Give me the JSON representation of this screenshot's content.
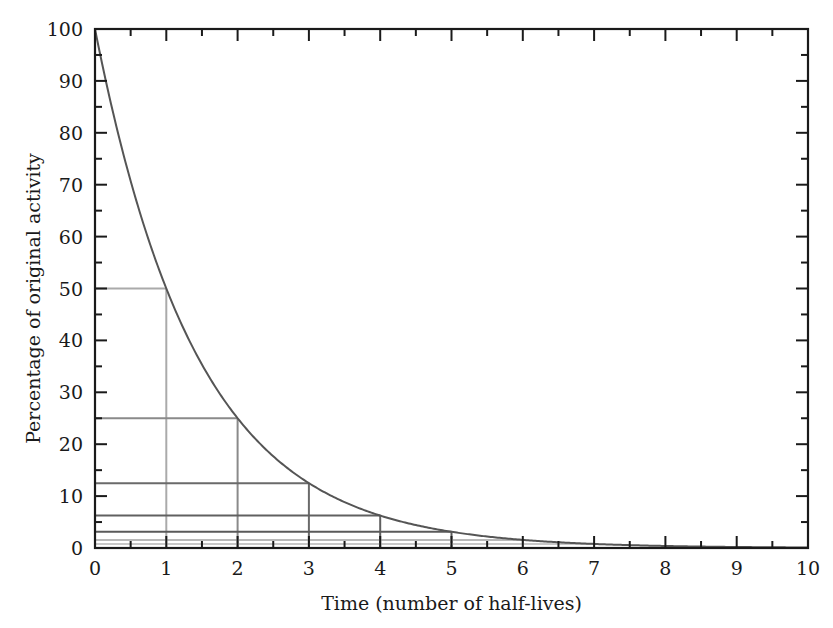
{
  "chart_data": {
    "type": "line",
    "title": "",
    "xlabel": "Time (number of half-lives)",
    "ylabel": "Percentage of original activity",
    "xlim": [
      0,
      10
    ],
    "ylim": [
      0,
      100
    ],
    "x_ticks": [
      0,
      1,
      2,
      3,
      4,
      5,
      6,
      7,
      8,
      9,
      10
    ],
    "y_ticks": [
      0,
      10,
      20,
      30,
      40,
      50,
      60,
      70,
      80,
      90,
      100
    ],
    "x_minor_step": 0.5,
    "y_minor_step": 5,
    "grid": false,
    "legend": null,
    "series": [
      {
        "name": "Activity remaining",
        "function": "100 * 0.5^x",
        "x": [
          0,
          1,
          2,
          3,
          4,
          5,
          6,
          7,
          8,
          9,
          10
        ],
        "values": [
          100,
          50,
          25,
          12.5,
          6.25,
          3.125,
          1.5625,
          0.78125,
          0.390625,
          0.1953125,
          0.09765625
        ],
        "color": "#555555"
      }
    ],
    "half_life_markers": [
      {
        "x": 1,
        "y": 50,
        "color": "#aaaaaa"
      },
      {
        "x": 2,
        "y": 25,
        "color": "#8a8a8a"
      },
      {
        "x": 3,
        "y": 12.5,
        "color": "#6a6a6a"
      },
      {
        "x": 4,
        "y": 6.25,
        "color": "#606060"
      },
      {
        "x": 5,
        "y": 3.125,
        "color": "#5a5a5a"
      },
      {
        "x": 6,
        "y": 1.5625,
        "color": "#b8b8b8"
      },
      {
        "x": 7,
        "y": 0.78125,
        "color": "#c8c8c8"
      }
    ]
  },
  "colors": {
    "axis": "#1a1a1a",
    "curve": "#555555",
    "background": "#ffffff"
  }
}
